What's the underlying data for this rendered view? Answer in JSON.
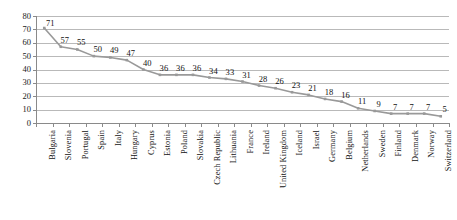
{
  "chart_data": {
    "type": "line",
    "title": "",
    "subtitle": "",
    "xlabel": "",
    "ylabel": "",
    "ylim": [
      0,
      80
    ],
    "yticks": [
      0,
      10,
      20,
      30,
      40,
      50,
      60,
      70,
      80
    ],
    "grid": true,
    "legend": "none",
    "data_labels": true,
    "marker": "small-square",
    "series_color": "#999999",
    "grid_color": "#b9b9b9",
    "axis_color": "#8a8a8a",
    "categories": [
      "Bulgaria",
      "Slovenia",
      "Portugal",
      "Spain",
      "Italy",
      "Hungary",
      "Cyprus",
      "Estonia",
      "Poland",
      "Slovakia",
      "Czech Republic",
      "Lithuania",
      "France",
      "Ireland",
      "United Kingdom",
      "Iceland",
      "Israel",
      "Germany",
      "Belgium",
      "Netherlands",
      "Sweden",
      "Finland",
      "Denmark",
      "Norway",
      "Switzerland"
    ],
    "values": [
      71,
      57,
      55,
      50,
      49,
      47,
      40,
      36,
      36,
      36,
      34,
      33,
      31,
      28,
      26,
      23,
      21,
      18,
      16,
      11,
      9,
      7,
      7,
      7,
      5
    ],
    "points": [
      {
        "category": "Bulgaria",
        "value": 71
      },
      {
        "category": "Slovenia",
        "value": 57
      },
      {
        "category": "Portugal",
        "value": 55
      },
      {
        "category": "Spain",
        "value": 50
      },
      {
        "category": "Italy",
        "value": 49
      },
      {
        "category": "Hungary",
        "value": 47
      },
      {
        "category": "Cyprus",
        "value": 40
      },
      {
        "category": "Estonia",
        "value": 36
      },
      {
        "category": "Poland",
        "value": 36
      },
      {
        "category": "Slovakia",
        "value": 36
      },
      {
        "category": "Czech Republic",
        "value": 34
      },
      {
        "category": "Lithuania",
        "value": 33
      },
      {
        "category": "France",
        "value": 31
      },
      {
        "category": "Ireland",
        "value": 28
      },
      {
        "category": "United Kingdom",
        "value": 26
      },
      {
        "category": "Iceland",
        "value": 23
      },
      {
        "category": "Israel",
        "value": 21
      },
      {
        "category": "Germany",
        "value": 18
      },
      {
        "category": "Belgium",
        "value": 16
      },
      {
        "category": "Netherlands",
        "value": 11
      },
      {
        "category": "Sweden",
        "value": 9
      },
      {
        "category": "Finland",
        "value": 7
      },
      {
        "category": "Denmark",
        "value": 7
      },
      {
        "category": "Norway",
        "value": 7
      },
      {
        "category": "Switzerland",
        "value": 5
      }
    ]
  }
}
